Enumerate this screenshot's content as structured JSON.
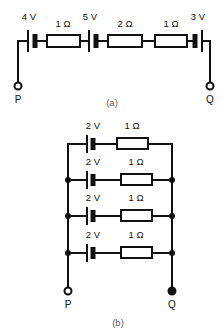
{
  "figure": {
    "background_color": "#ffffff",
    "ink_color": "#111111",
    "caption_color": "#5a5a5a"
  },
  "circuit_a": {
    "caption": "(a)",
    "topology": "series",
    "terminals": [
      {
        "name": "P",
        "label": "P",
        "style": "open",
        "side": "left"
      },
      {
        "name": "Q",
        "label": "Q",
        "style": "open",
        "side": "right"
      }
    ],
    "components": [
      {
        "type": "battery",
        "label": "4 V",
        "value": 4,
        "unit": "V",
        "polarity": "thin-left-thick-right"
      },
      {
        "type": "resistor",
        "label": "1 Ω",
        "value": 1,
        "unit": "Ω"
      },
      {
        "type": "battery",
        "label": "5 V",
        "value": 5,
        "unit": "V",
        "polarity": "thin-left-thick-right"
      },
      {
        "type": "resistor",
        "label": "2 Ω",
        "value": 2,
        "unit": "Ω"
      },
      {
        "type": "resistor",
        "label": "1 Ω",
        "value": 1,
        "unit": "Ω"
      },
      {
        "type": "battery",
        "label": "3 V",
        "value": 3,
        "unit": "V",
        "polarity": "thick-left-thin-right"
      }
    ]
  },
  "circuit_b": {
    "caption": "(b)",
    "topology": "parallel",
    "branch_count": 4,
    "terminals": [
      {
        "name": "P",
        "label": "P",
        "style": "open",
        "side": "left"
      },
      {
        "name": "Q",
        "label": "Q",
        "style": "filled",
        "side": "right"
      }
    ],
    "branches": [
      {
        "index": 1,
        "battery": {
          "type": "battery",
          "label": "2 V",
          "value": 2,
          "unit": "V",
          "polarity": "thin-left-thick-right"
        },
        "resistor": {
          "type": "resistor",
          "label": "1 Ω",
          "value": 1,
          "unit": "Ω"
        },
        "left_node": "none",
        "right_node": "none"
      },
      {
        "index": 2,
        "battery": {
          "type": "battery",
          "label": "2 V",
          "value": 2,
          "unit": "V",
          "polarity": "thin-left-thick-right"
        },
        "resistor": {
          "type": "resistor",
          "label": "1 Ω",
          "value": 1,
          "unit": "Ω"
        },
        "left_node": "dot",
        "right_node": "dot"
      },
      {
        "index": 3,
        "battery": {
          "type": "battery",
          "label": "2 V",
          "value": 2,
          "unit": "V",
          "polarity": "thin-left-thick-right"
        },
        "resistor": {
          "type": "resistor",
          "label": "1 Ω",
          "value": 1,
          "unit": "Ω"
        },
        "left_node": "dot",
        "right_node": "dot"
      },
      {
        "index": 4,
        "battery": {
          "type": "battery",
          "label": "2 V",
          "value": 2,
          "unit": "V",
          "polarity": "thin-left-thick-right"
        },
        "resistor": {
          "type": "resistor",
          "label": "1 Ω",
          "value": 1,
          "unit": "Ω"
        },
        "left_node": "dot",
        "right_node": "dot"
      }
    ]
  }
}
